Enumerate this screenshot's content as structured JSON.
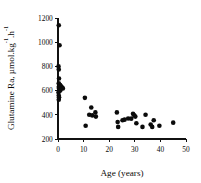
{
  "chart_data": {
    "type": "scatter",
    "title": "",
    "xlabel": "Age (years)",
    "ylabel": "Glutamine Ra, µmol.kg⁻¹.h⁻¹",
    "ylabel_parts": {
      "main": "Glutamine Ra, µmol.kg",
      "sup1": "-1",
      "mid": ".h",
      "sup2": "-1"
    },
    "xlim": [
      0,
      50
    ],
    "ylim": [
      200,
      1200
    ],
    "xticks": [
      0,
      10,
      20,
      30,
      40,
      50
    ],
    "yticks": [
      200,
      400,
      600,
      800,
      1000,
      1200
    ],
    "xtick_labels": [
      "0",
      "10",
      "20",
      "30",
      "40",
      "50"
    ],
    "ytick_labels": [
      "200",
      "400",
      "600",
      "800",
      "1000",
      "1200"
    ],
    "grid": false,
    "legend": false,
    "marker_style": "filled-circle",
    "marker_color": "#0b0b0b",
    "marker_size": 2.3,
    "axis_color": "#111111",
    "background_color": "#ffffff",
    "series": [
      {
        "name": "Glutamine Ra",
        "points": [
          [
            0.3,
            1140
          ],
          [
            0.6,
            975
          ],
          [
            0.2,
            800
          ],
          [
            0.3,
            775
          ],
          [
            0.4,
            700
          ],
          [
            0.3,
            660
          ],
          [
            0.5,
            650
          ],
          [
            0.8,
            645
          ],
          [
            1.0,
            640
          ],
          [
            1.3,
            632
          ],
          [
            1.6,
            625
          ],
          [
            1.9,
            618
          ],
          [
            0.3,
            630
          ],
          [
            0.4,
            615
          ],
          [
            0.6,
            608
          ],
          [
            0.9,
            600
          ],
          [
            0.2,
            585
          ],
          [
            0.3,
            560
          ],
          [
            0.4,
            545
          ],
          [
            0.3,
            525
          ],
          [
            10.5,
            540
          ],
          [
            10.8,
            310
          ],
          [
            12.2,
            400
          ],
          [
            13.0,
            460
          ],
          [
            13.4,
            395
          ],
          [
            14.6,
            420
          ],
          [
            14.8,
            385
          ],
          [
            23.0,
            420
          ],
          [
            23.3,
            340
          ],
          [
            23.5,
            300
          ],
          [
            25.2,
            355
          ],
          [
            26.0,
            360
          ],
          [
            27.4,
            370
          ],
          [
            28.6,
            368
          ],
          [
            29.3,
            408
          ],
          [
            29.8,
            395
          ],
          [
            30.2,
            385
          ],
          [
            30.6,
            330
          ],
          [
            33.0,
            300
          ],
          [
            34.2,
            400
          ],
          [
            36.2,
            320
          ],
          [
            36.8,
            300
          ],
          [
            37.4,
            355
          ],
          [
            39.6,
            310
          ],
          [
            45.0,
            335
          ]
        ]
      }
    ]
  }
}
